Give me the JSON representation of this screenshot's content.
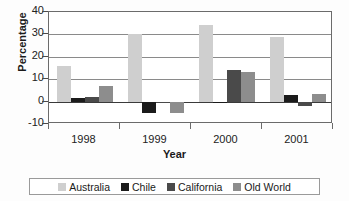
{
  "chart_data": {
    "type": "bar",
    "title": "",
    "xlabel": "Year",
    "ylabel": "Percentage",
    "categories": [
      "1998",
      "1999",
      "2000",
      "2001"
    ],
    "ylim": [
      -10,
      40
    ],
    "yticks": [
      40,
      30,
      20,
      10,
      0,
      -10
    ],
    "ytick_labels": [
      "40",
      "30",
      "20",
      "10",
      "0",
      "-10"
    ],
    "grid": true,
    "legend_position": "bottom",
    "series": [
      {
        "name": "Australia",
        "color": "#cfcfcf",
        "values": [
          16,
          30,
          34,
          29
        ]
      },
      {
        "name": "Chile",
        "color": "#1b1b1b",
        "values": [
          1.5,
          -5,
          0,
          3
        ]
      },
      {
        "name": "California",
        "color": "#4a4a4a",
        "values": [
          2,
          0,
          14,
          -2
        ]
      },
      {
        "name": "Old World",
        "color": "#8d8d8d",
        "values": [
          7,
          -5,
          13,
          3.5
        ]
      }
    ]
  },
  "axis": {
    "y_title": "Percentage",
    "x_title": "Year",
    "y_tick_labels": [
      "40",
      "30",
      "20",
      "10",
      "0",
      "-10"
    ],
    "x_tick_labels": [
      "1998",
      "1999",
      "2000",
      "2001"
    ]
  },
  "legend": {
    "items": [
      {
        "label": "Australia",
        "color": "#cfcfcf"
      },
      {
        "label": "Chile",
        "color": "#1b1b1b"
      },
      {
        "label": "California",
        "color": "#4a4a4a"
      },
      {
        "label": "Old World",
        "color": "#8d8d8d"
      }
    ]
  }
}
